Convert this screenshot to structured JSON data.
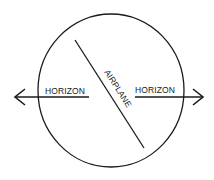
{
  "diagram": {
    "type": "attitude-indicator-illustration",
    "labels": {
      "horizon_left": "HORIZON",
      "horizon_right": "HORIZON",
      "airplane": "AIRPLANE"
    },
    "colors": {
      "stroke": "#1a1a1a",
      "background": "#ffffff"
    }
  }
}
